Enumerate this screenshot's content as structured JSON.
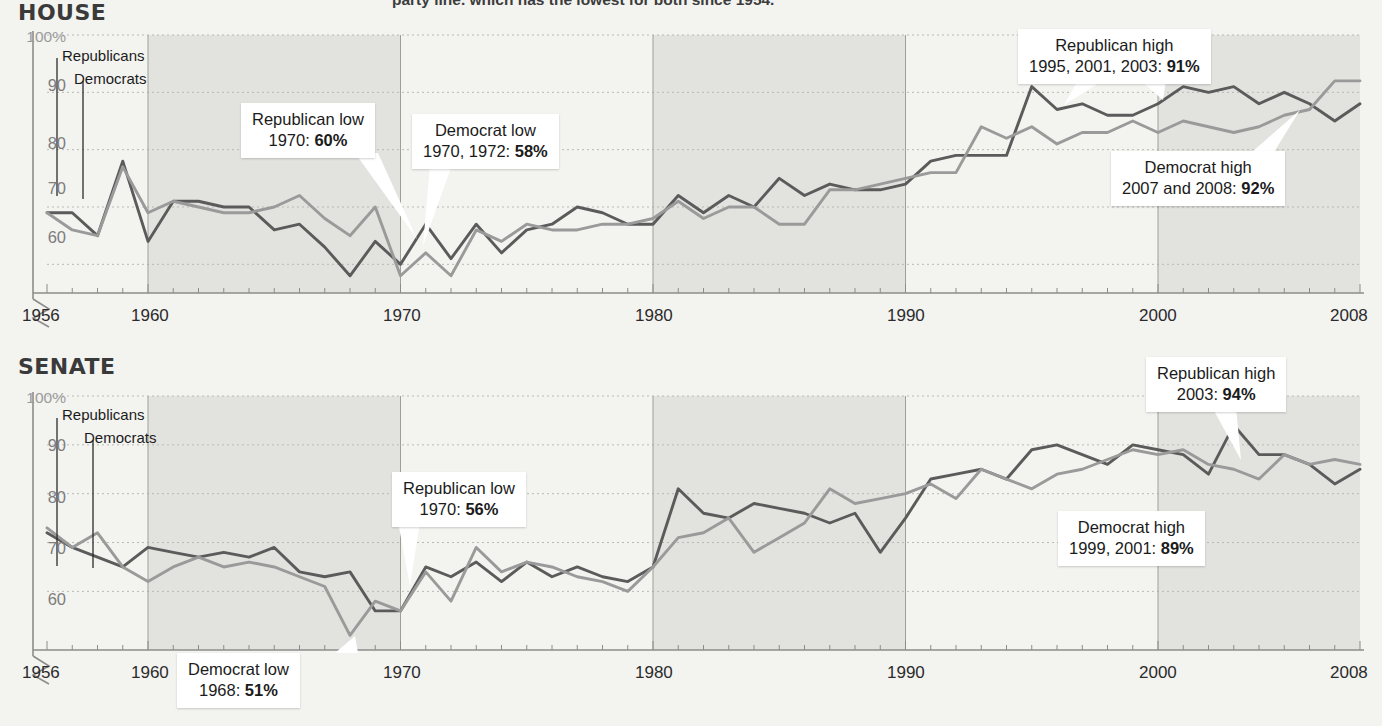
{
  "page": {
    "background_color": "#f3f3f0",
    "cropped_headline": "party line. which has the lowest for both since 1954."
  },
  "colors": {
    "republican_line": "#5b5b5b",
    "democrat_line": "#9a9a9a",
    "band_shade": "#e2e2df",
    "axis": "#8c8c8c",
    "callout_bg": "#ffffff",
    "title": "#3a3a3a"
  },
  "legend": {
    "republicans": "Republicans",
    "democrats": "Democrats"
  },
  "axis": {
    "y_ticks": [
      "100%",
      "90",
      "80",
      "70",
      "60"
    ],
    "y_values": [
      100,
      90,
      80,
      70,
      60
    ],
    "x_ticks": [
      "1956",
      "1960",
      "1970",
      "1980",
      "1990",
      "2000",
      "2008"
    ],
    "x_values": [
      1956,
      1960,
      1970,
      1980,
      1990,
      2000,
      2008
    ],
    "shaded_bands": [
      [
        1960,
        1970
      ],
      [
        1980,
        1990
      ],
      [
        2000,
        2008
      ]
    ]
  },
  "chart_data": [
    {
      "type": "line",
      "title": "HOUSE",
      "xlabel": "",
      "ylabel": "",
      "xlim": [
        1956,
        2008
      ],
      "ylim": [
        55,
        100
      ],
      "grid": true,
      "legend_position": "inline-left",
      "x": [
        1956,
        1957,
        1958,
        1959,
        1960,
        1961,
        1962,
        1963,
        1964,
        1965,
        1966,
        1967,
        1968,
        1969,
        1970,
        1971,
        1972,
        1973,
        1974,
        1975,
        1976,
        1977,
        1978,
        1979,
        1980,
        1981,
        1982,
        1983,
        1984,
        1985,
        1986,
        1987,
        1988,
        1989,
        1990,
        1991,
        1992,
        1993,
        1994,
        1995,
        1996,
        1997,
        1998,
        1999,
        2000,
        2001,
        2002,
        2003,
        2004,
        2005,
        2006,
        2007,
        2008
      ],
      "series": [
        {
          "name": "Republicans",
          "color": "#5b5b5b",
          "values": [
            69,
            69,
            65,
            78,
            64,
            71,
            71,
            70,
            70,
            66,
            67,
            63,
            58,
            64,
            60,
            67,
            61,
            67,
            62,
            66,
            67,
            70,
            69,
            67,
            67,
            72,
            69,
            72,
            70,
            75,
            72,
            74,
            73,
            73,
            74,
            78,
            79,
            79,
            79,
            91,
            87,
            88,
            86,
            86,
            88,
            91,
            90,
            91,
            88,
            90,
            88,
            85,
            88
          ]
        },
        {
          "name": "Democrats",
          "color": "#9a9a9a",
          "values": [
            69,
            66,
            65,
            77,
            69,
            71,
            70,
            69,
            69,
            70,
            72,
            68,
            65,
            70,
            58,
            62,
            58,
            66,
            64,
            67,
            66,
            66,
            67,
            67,
            68,
            71,
            68,
            70,
            70,
            67,
            67,
            73,
            73,
            74,
            75,
            76,
            76,
            84,
            82,
            84,
            81,
            83,
            83,
            85,
            83,
            85,
            84,
            83,
            84,
            86,
            87,
            92,
            92
          ]
        }
      ],
      "annotations": [
        {
          "title": "Republican low",
          "detail_prefix": "1970: ",
          "detail_value": "60%"
        },
        {
          "title": "Democrat low",
          "detail_prefix": "1970, 1972: ",
          "detail_value": "58%"
        },
        {
          "title": "Republican high",
          "detail_prefix": "1995, 2001, 2003: ",
          "detail_value": "91%"
        },
        {
          "title": "Democrat high",
          "detail_prefix": "2007 and 2008: ",
          "detail_value": "92%"
        }
      ]
    },
    {
      "type": "line",
      "title": "SENATE",
      "xlabel": "",
      "ylabel": "",
      "xlim": [
        1956,
        2008
      ],
      "ylim": [
        50,
        100
      ],
      "grid": true,
      "legend_position": "inline-left",
      "x": [
        1956,
        1957,
        1958,
        1959,
        1960,
        1961,
        1962,
        1963,
        1964,
        1965,
        1966,
        1967,
        1968,
        1969,
        1970,
        1971,
        1972,
        1973,
        1974,
        1975,
        1976,
        1977,
        1978,
        1979,
        1980,
        1981,
        1982,
        1983,
        1984,
        1985,
        1986,
        1987,
        1988,
        1989,
        1990,
        1991,
        1992,
        1993,
        1994,
        1995,
        1996,
        1997,
        1998,
        1999,
        2000,
        2001,
        2002,
        2003,
        2004,
        2005,
        2006,
        2007,
        2008
      ],
      "series": [
        {
          "name": "Republicans",
          "color": "#5b5b5b",
          "values": [
            72,
            69,
            67,
            65,
            69,
            68,
            67,
            68,
            67,
            69,
            64,
            63,
            64,
            56,
            56,
            65,
            63,
            66,
            62,
            66,
            63,
            65,
            63,
            62,
            65,
            81,
            76,
            75,
            78,
            77,
            76,
            74,
            76,
            68,
            75,
            83,
            84,
            85,
            83,
            89,
            90,
            88,
            86,
            90,
            89,
            88,
            84,
            94,
            88,
            88,
            86,
            82,
            85
          ]
        },
        {
          "name": "Democrats",
          "color": "#9a9a9a",
          "values": [
            73,
            69,
            72,
            65,
            62,
            65,
            67,
            65,
            66,
            65,
            63,
            61,
            51,
            58,
            56,
            64,
            58,
            69,
            64,
            66,
            65,
            63,
            62,
            60,
            65,
            71,
            72,
            75,
            68,
            71,
            74,
            81,
            78,
            79,
            80,
            82,
            79,
            85,
            83,
            81,
            84,
            85,
            87,
            89,
            88,
            89,
            86,
            85,
            83,
            88,
            86,
            87,
            86
          ]
        }
      ],
      "annotations": [
        {
          "title": "Republican low",
          "detail_prefix": "1970: ",
          "detail_value": "56%"
        },
        {
          "title": "Democrat low",
          "detail_prefix": "1968: ",
          "detail_value": "51%"
        },
        {
          "title": "Republican high",
          "detail_prefix": "2003: ",
          "detail_value": "94%"
        },
        {
          "title": "Democrat high",
          "detail_prefix": "1999, 2001: ",
          "detail_value": "89%"
        }
      ]
    }
  ]
}
